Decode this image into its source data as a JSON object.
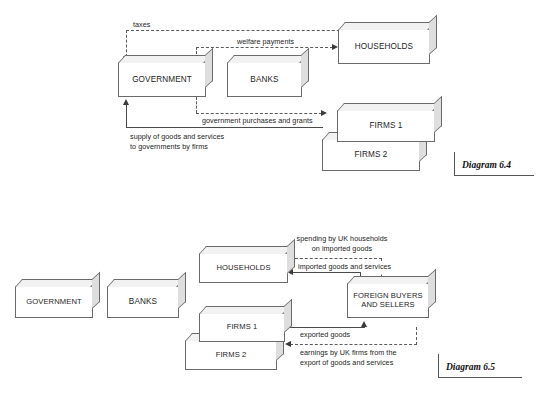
{
  "page": {
    "width": 539,
    "height": 397,
    "background": "#ffffff",
    "line_color": "#4a4a4a",
    "box_border_color": "#6a6a6a",
    "box_fill": "#ffffff",
    "box_top_face": "#f2f2f2",
    "box_side_face": "#dedede"
  },
  "diagram_64": {
    "tag": "Diagram 6.4",
    "boxes": {
      "government": "GOVERNMENT",
      "banks": "BANKS",
      "households": "HOUSEHOLDS",
      "firms1": "FIRMS 1",
      "firms2": "FIRMS 2"
    },
    "flows": {
      "taxes": "taxes",
      "welfare_payments": "welfare payments",
      "government_purchases": "government purchases and grants",
      "supply_of_goods": "supply of goods and services\nto governments by firms"
    }
  },
  "diagram_65": {
    "tag": "Diagram 6.5",
    "boxes": {
      "government": "GOVERNMENT",
      "banks": "BANKS",
      "households": "HOUSEHOLDS",
      "firms1": "FIRMS 1",
      "firms2": "FIRMS 2",
      "foreign": "FOREIGN BUYERS\nAND SELLERS"
    },
    "flows": {
      "spending_imported": "spending by UK households\non imported goods",
      "imported_goods": "imported goods and services",
      "exported_goods": "exported goods",
      "earnings_exports": "earnings by UK firms from the\nexport of goods and services"
    }
  }
}
